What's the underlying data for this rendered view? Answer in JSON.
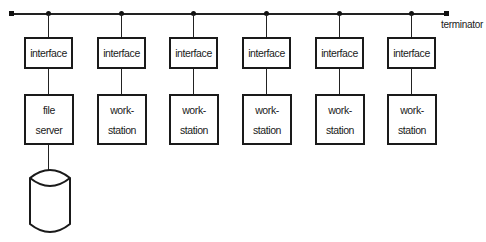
{
  "diagram": {
    "type": "bus-network",
    "bus": {
      "terminator_label": "terminator"
    },
    "nodes": [
      {
        "interface": "interface",
        "host_line1": "file",
        "host_line2": "server",
        "has_disk": true,
        "center_x": 48
      },
      {
        "interface": "interface",
        "host_line1": "work-",
        "host_line2": "station",
        "has_disk": false,
        "center_x": 121
      },
      {
        "interface": "interface",
        "host_line1": "work-",
        "host_line2": "station",
        "has_disk": false,
        "center_x": 193
      },
      {
        "interface": "interface",
        "host_line1": "work-",
        "host_line2": "station",
        "has_disk": false,
        "center_x": 266
      },
      {
        "interface": "interface",
        "host_line1": "work-",
        "host_line2": "station",
        "has_disk": false,
        "center_x": 339
      },
      {
        "interface": "interface",
        "host_line1": "work-",
        "host_line2": "station",
        "has_disk": false,
        "center_x": 411
      }
    ],
    "disk": {
      "label": ""
    }
  }
}
